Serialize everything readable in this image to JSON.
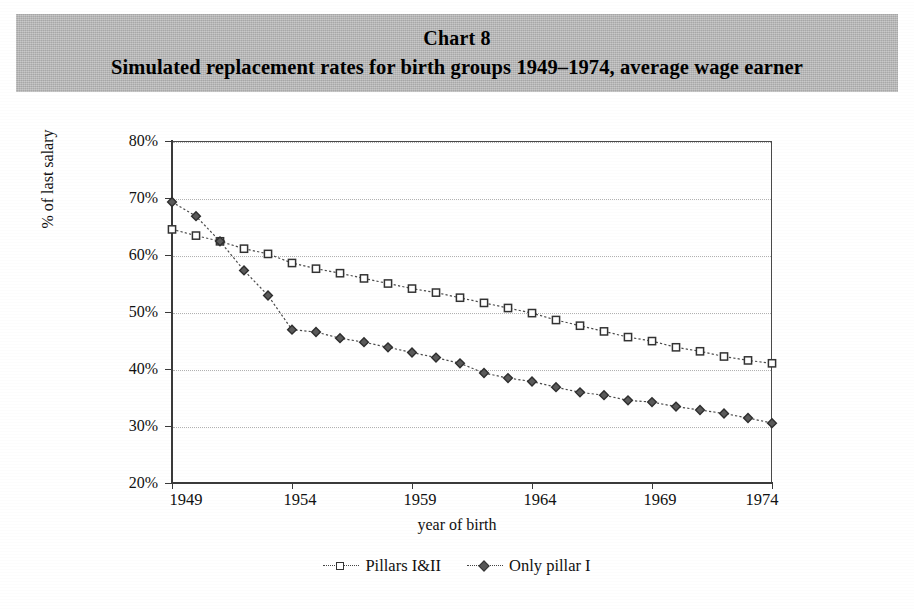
{
  "banner": {
    "chart_label": "Chart 8",
    "subtitle": "Simulated replacement rates for birth groups 1949–1974, average wage earner",
    "background_color": "#b9b9b9"
  },
  "chart_data": {
    "type": "line",
    "title": "Chart 8",
    "subtitle": "Simulated replacement rates for birth groups 1949–1974, average wage earner",
    "xlabel": "year of birth",
    "ylabel": "% of last salary",
    "x": [
      1949,
      1950,
      1951,
      1952,
      1953,
      1954,
      1955,
      1956,
      1957,
      1958,
      1959,
      1960,
      1961,
      1962,
      1963,
      1964,
      1965,
      1966,
      1967,
      1968,
      1969,
      1970,
      1971,
      1972,
      1973,
      1974
    ],
    "xlim": [
      1949,
      1974
    ],
    "ylim": [
      20,
      80
    ],
    "yticks": [
      20,
      30,
      40,
      50,
      60,
      70,
      80
    ],
    "ytick_labels": [
      "20%",
      "30%",
      "40%",
      "50%",
      "60%",
      "70%",
      "80%"
    ],
    "xticks": [
      1949,
      1954,
      1959,
      1964,
      1969,
      1974
    ],
    "xtick_labels": [
      "1949",
      "1954",
      "1959",
      "1964",
      "1969",
      "1974"
    ],
    "grid": true,
    "grid_style": "dotted horizontal",
    "legend_position": "bottom",
    "series": [
      {
        "name": "Pillars I&II",
        "marker": "square",
        "line_style": "dotted",
        "color": "#4a4a4a",
        "values": [
          64.5,
          63.4,
          62.4,
          61.1,
          60.2,
          58.6,
          57.6,
          56.8,
          55.9,
          55.0,
          54.1,
          53.4,
          52.5,
          51.6,
          50.7,
          49.8,
          48.6,
          47.6,
          46.6,
          45.6,
          44.9,
          43.8,
          43.1,
          42.2,
          41.5,
          41.0
        ]
      },
      {
        "name": "Only pillar I",
        "marker": "diamond",
        "line_style": "dotted",
        "color": "#4a4a4a",
        "values": [
          69.3,
          66.8,
          62.4,
          57.3,
          52.9,
          46.9,
          46.5,
          45.4,
          44.7,
          43.8,
          42.9,
          42.0,
          41.0,
          39.3,
          38.4,
          37.8,
          36.8,
          35.9,
          35.4,
          34.5,
          34.2,
          33.4,
          32.8,
          32.2,
          31.4,
          30.5
        ]
      }
    ]
  },
  "legend": {
    "items": [
      {
        "label": "Pillars I&II",
        "marker": "square"
      },
      {
        "label": "Only pillar I",
        "marker": "diamond"
      }
    ]
  }
}
